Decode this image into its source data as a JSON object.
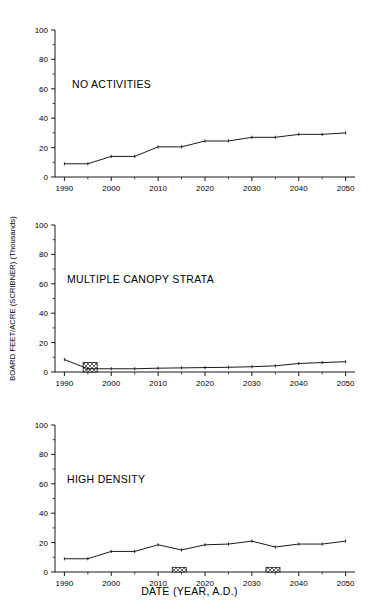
{
  "figure": {
    "axis_title_y": "BOARD FEET/ACRE (SCRIBNER) (Thousands)",
    "axis_title_x": "DATE (YEAR, A.D.)",
    "line_color": "#000000",
    "background_color": "#ffffff"
  },
  "chart_data": [
    {
      "type": "line",
      "title": "NO ACTIVITIES",
      "xlabel": "DATE (YEAR, A.D.)",
      "ylabel": "BOARD FEET/ACRE (SCRIBNER) (Thousands)",
      "xlim": [
        1988,
        2052
      ],
      "ylim": [
        0,
        100
      ],
      "yticks": [
        0,
        20,
        40,
        60,
        80,
        100
      ],
      "xticks": [
        1990,
        2000,
        2010,
        2020,
        2030,
        2040,
        2050
      ],
      "ytick_labels": [
        "0",
        "20",
        "40",
        "60",
        "80",
        "100"
      ],
      "xtick_labels": [
        "1990",
        "2000",
        "2010",
        "2020",
        "2030",
        "2040",
        "2050"
      ],
      "grid": false,
      "legend": false,
      "x": [
        1990,
        1995,
        2000,
        2005,
        2010,
        2015,
        2020,
        2025,
        2030,
        2035,
        2040,
        2045,
        2050
      ],
      "values": [
        9.0,
        9.0,
        14.0,
        14.0,
        20.5,
        20.5,
        24.5,
        24.5,
        27.0,
        27.0,
        29.0,
        29.0,
        30.0
      ],
      "treatment_bars": []
    },
    {
      "type": "line",
      "title": "MULTIPLE CANOPY STRATA",
      "xlabel": "DATE (YEAR, A.D.)",
      "ylabel": "BOARD FEET/ACRE (SCRIBNER) (Thousands)",
      "xlim": [
        1988,
        2052
      ],
      "ylim": [
        0,
        100
      ],
      "yticks": [
        0,
        20,
        40,
        60,
        80,
        100
      ],
      "xticks": [
        1990,
        2000,
        2010,
        2020,
        2030,
        2040,
        2050
      ],
      "ytick_labels": [
        "0",
        "20",
        "40",
        "60",
        "80",
        "100"
      ],
      "xtick_labels": [
        "1990",
        "2000",
        "2010",
        "2020",
        "2030",
        "2040",
        "2050"
      ],
      "grid": false,
      "legend": false,
      "x": [
        1990,
        1995,
        2000,
        2005,
        2010,
        2015,
        2020,
        2025,
        2030,
        2035,
        2040,
        2045,
        2050
      ],
      "values": [
        8.5,
        2.2,
        2.2,
        2.2,
        2.6,
        2.8,
        3.0,
        3.2,
        3.6,
        4.2,
        5.8,
        6.4,
        7.0
      ],
      "treatment_bars": [
        {
          "x_start": 1994,
          "x_end": 1997,
          "height": 6.5,
          "hatch": "crosshatch"
        }
      ]
    },
    {
      "type": "line",
      "title": "HIGH DENSITY",
      "xlabel": "DATE (YEAR, A.D.)",
      "ylabel": "BOARD FEET/ACRE (SCRIBNER) (Thousands)",
      "xlim": [
        1988,
        2052
      ],
      "ylim": [
        0,
        100
      ],
      "yticks": [
        0,
        20,
        40,
        60,
        80,
        100
      ],
      "xticks": [
        1990,
        2000,
        2010,
        2020,
        2030,
        2040,
        2050
      ],
      "ytick_labels": [
        "0",
        "20",
        "40",
        "60",
        "80",
        "100"
      ],
      "xtick_labels": [
        "1990",
        "2000",
        "2010",
        "2020",
        "2030",
        "2040",
        "2050"
      ],
      "grid": false,
      "legend": false,
      "x": [
        1990,
        1995,
        2000,
        2005,
        2010,
        2015,
        2020,
        2025,
        2030,
        2035,
        2040,
        2045,
        2050
      ],
      "values": [
        9.0,
        9.0,
        14.0,
        14.0,
        18.5,
        15.0,
        18.5,
        19.0,
        21.0,
        17.0,
        19.0,
        19.0,
        21.0
      ],
      "treatment_bars": [
        {
          "x_start": 2013,
          "x_end": 2016,
          "height": 3.2,
          "hatch": "crosshatch"
        },
        {
          "x_start": 2033,
          "x_end": 2036,
          "height": 3.2,
          "hatch": "crosshatch"
        }
      ]
    }
  ]
}
